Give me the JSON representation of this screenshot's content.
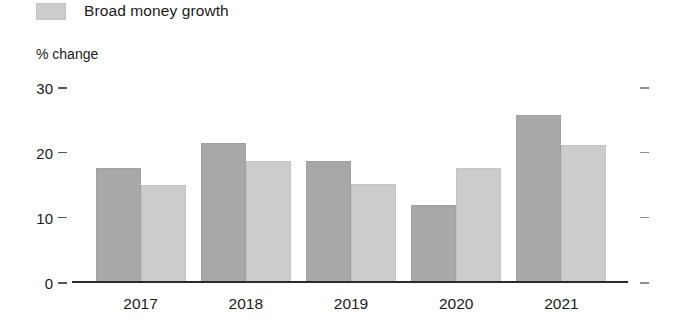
{
  "legend": {
    "position": "top-left",
    "entries": [
      {
        "label": "Broad money growth",
        "color": "#cccccc"
      }
    ]
  },
  "axis": {
    "ylabel": "% change",
    "ytick_labels": [
      "30",
      "20",
      "10",
      "0"
    ]
  },
  "colors": {
    "series_dark": "#a8a8a8",
    "series_light": "#cccccc",
    "axis_line": "#2b2b2b",
    "background": "#ffffff"
  },
  "chart_data": {
    "type": "bar",
    "title": "",
    "subtitle": "",
    "xlabel": "",
    "ylabel": "% change",
    "ylim": [
      0,
      30
    ],
    "yticks": [
      0,
      10,
      20,
      30
    ],
    "grid": false,
    "legend_position": "top-left",
    "categories": [
      "2017",
      "2018",
      "2019",
      "2020",
      "2021"
    ],
    "series": [
      {
        "name": "Series 1",
        "color": "#a8a8a8",
        "values": [
          17.7,
          21.5,
          18.7,
          12.0,
          25.8
        ]
      },
      {
        "name": "Broad money growth",
        "color": "#cccccc",
        "values": [
          15.1,
          18.8,
          15.3,
          17.7,
          21.2
        ]
      }
    ]
  }
}
